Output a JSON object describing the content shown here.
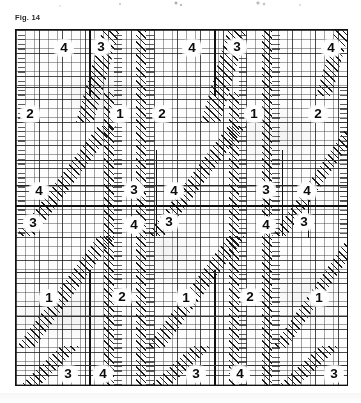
{
  "figure": {
    "label": "Fig. 14",
    "caption_position": "top-left"
  },
  "plate": {
    "description": "graph-paper weave/point-paper diagram with numbered repeat regions",
    "background_color": "#fdfdfd",
    "line_color": "#111111",
    "grid": {
      "fine_pitch_px": 4.6,
      "coarse_pitch_px": 23,
      "fine_color": "#282828",
      "coarse_color": "#141414"
    }
  },
  "cells": [
    {
      "label": "4",
      "x": 63,
      "y": 47
    },
    {
      "label": "3",
      "x": 100,
      "y": 46
    },
    {
      "label": "4",
      "x": 191,
      "y": 47
    },
    {
      "label": "3",
      "x": 236,
      "y": 46
    },
    {
      "label": "4",
      "x": 330,
      "y": 47
    },
    {
      "label": "2",
      "x": 29,
      "y": 113
    },
    {
      "label": "1",
      "x": 119,
      "y": 113
    },
    {
      "label": "2",
      "x": 161,
      "y": 113
    },
    {
      "label": "1",
      "x": 253,
      "y": 113
    },
    {
      "label": "2",
      "x": 317,
      "y": 113
    },
    {
      "label": "4",
      "x": 38,
      "y": 190
    },
    {
      "label": "3",
      "x": 133,
      "y": 189
    },
    {
      "label": "4",
      "x": 173,
      "y": 190
    },
    {
      "label": "3",
      "x": 265,
      "y": 189
    },
    {
      "label": "4",
      "x": 306,
      "y": 190
    },
    {
      "label": "3",
      "x": 32,
      "y": 222
    },
    {
      "label": "4",
      "x": 133,
      "y": 224
    },
    {
      "label": "3",
      "x": 168,
      "y": 221
    },
    {
      "label": "4",
      "x": 265,
      "y": 224
    },
    {
      "label": "3",
      "x": 303,
      "y": 221
    },
    {
      "label": "1",
      "x": 48,
      "y": 297
    },
    {
      "label": "2",
      "x": 121,
      "y": 296
    },
    {
      "label": "1",
      "x": 185,
      "y": 297
    },
    {
      "label": "2",
      "x": 249,
      "y": 296
    },
    {
      "label": "1",
      "x": 318,
      "y": 297
    },
    {
      "label": "3",
      "x": 67,
      "y": 373
    },
    {
      "label": "4",
      "x": 102,
      "y": 373
    },
    {
      "label": "3",
      "x": 195,
      "y": 373
    },
    {
      "label": "4",
      "x": 239,
      "y": 373
    },
    {
      "label": "3",
      "x": 333,
      "y": 373
    }
  ],
  "structure": {
    "major_horizontal_rules_y": [
      205
    ],
    "minor_horizontal_rules_y": [
      120,
      165,
      245,
      320
    ],
    "major_vertical_rules_x": [
      88,
      213
    ],
    "secondary_vertical_rules_x": [
      155,
      280
    ],
    "diagonal_band_count": 6,
    "vertical_hatch_band_count": 4
  },
  "rows": {
    "row_1": [
      "4",
      "3",
      "4",
      "3",
      "4"
    ],
    "row_2": [
      "2",
      "1",
      "2",
      "1",
      "2"
    ],
    "row_3": [
      "4",
      "3",
      "4",
      "3",
      "4"
    ],
    "row_4": [
      "3",
      "4",
      "3",
      "4",
      "3"
    ],
    "row_5": [
      "1",
      "2",
      "1",
      "2",
      "1"
    ],
    "row_6": [
      "3",
      "4",
      "3",
      "4",
      "3"
    ]
  }
}
